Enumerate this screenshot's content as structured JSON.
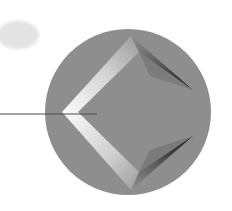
{
  "scene": {
    "description": "Abstract illustration: gray sphere with a beveled diamond shape and a pointer line",
    "colors": {
      "background": "#ffffff",
      "ellipse": "#e3e3e3",
      "circle": "#8e8e8e",
      "bevel_light": "#f2f2f2",
      "bevel_mid": "#b4b4b4",
      "shadow_dark": "#1e1e1e",
      "line": "#4a4a4a"
    },
    "ellipse": {
      "cx": 18,
      "cy": 35,
      "rx": 21,
      "ry": 14
    },
    "circle": {
      "cx": 128,
      "cy": 112,
      "r": 83
    },
    "line": {
      "x1": 0,
      "y1": 114,
      "x2": 97,
      "y2": 114
    }
  }
}
